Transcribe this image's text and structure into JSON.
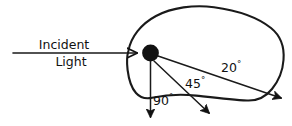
{
  "figure": {
    "background_color": "#ffffff",
    "ink_color": "#111111",
    "width": 292,
    "height": 126
  },
  "source_label": {
    "line1": "Incident",
    "line2": "Light"
  },
  "angles": {
    "wide": {
      "value": "20",
      "degree": "°",
      "full": "20°"
    },
    "mid": {
      "value": "45",
      "degree": "°",
      "full": "45°"
    },
    "normal": {
      "value": "90",
      "degree": "°",
      "full": "90°"
    }
  },
  "elements": {
    "particle_name": "scattering-particle",
    "blob_name": "irregular-particle-outline",
    "incident_arrow_name": "incident-light-arrow"
  }
}
